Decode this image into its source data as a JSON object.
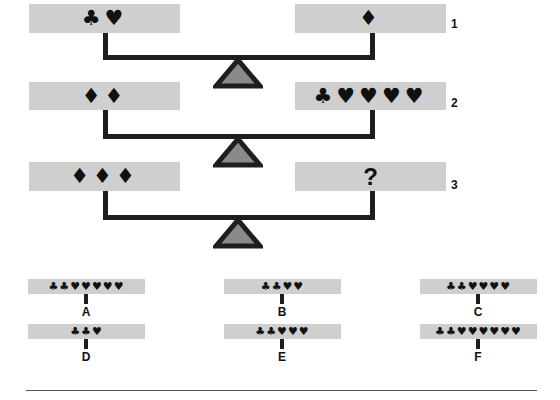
{
  "colors": {
    "pan": "#cfcfcf",
    "beam": "#1e1e1e",
    "fulcrum_fill": "#8a8a8a",
    "fulcrum_stroke": "#1e1e1e"
  },
  "scales": [
    {
      "number": "1",
      "left": "♣♥",
      "right": "♦"
    },
    {
      "number": "2",
      "left": "♦♦",
      "right": "♣♥♥♥♥"
    },
    {
      "number": "3",
      "left": "♦♦♦",
      "right": "?"
    }
  ],
  "options": [
    {
      "label": "A",
      "symbols": "♣♣♥♥♥♥♥"
    },
    {
      "label": "B",
      "symbols": "♣♣♥♥"
    },
    {
      "label": "C",
      "symbols": "♣♣♥♥♥♥"
    },
    {
      "label": "D",
      "symbols": "♣♣♥"
    },
    {
      "label": "E",
      "symbols": "♣♣♥♥♥"
    },
    {
      "label": "F",
      "symbols": "♣♣♥♥♥♥♥♥"
    }
  ]
}
